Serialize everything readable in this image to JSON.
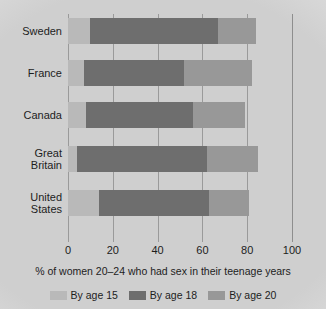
{
  "chart_data": {
    "type": "bar",
    "orientation": "horizontal",
    "stacked": false,
    "overlapping": true,
    "title": "",
    "xlabel": "% of women 20–24 who had sex in their teenage years",
    "ylabel": "",
    "xlim": [
      0,
      100
    ],
    "xticks": [
      0,
      20,
      40,
      60,
      80,
      100
    ],
    "xtick_labels": [
      "0",
      "20",
      "40",
      "60",
      "80",
      "100"
    ],
    "grid": true,
    "legend_position": "bottom",
    "categories": [
      "Sweden",
      "France",
      "Canada",
      "Great Britain",
      "United States"
    ],
    "category_lines": [
      [
        "Sweden"
      ],
      [
        "France"
      ],
      [
        "Canada"
      ],
      [
        "Great",
        "Britain"
      ],
      [
        "United",
        "States"
      ]
    ],
    "series": [
      {
        "name": "By age 15",
        "color": "#b9b9b9",
        "values": [
          10,
          7,
          8,
          4,
          14
        ]
      },
      {
        "name": "By age 18",
        "color": "#6e6e6e",
        "values": [
          67,
          52,
          56,
          62,
          63
        ]
      },
      {
        "name": "By age 20",
        "color": "#989898",
        "values": [
          84,
          82,
          79,
          85,
          81
        ]
      }
    ]
  },
  "legend": {
    "items": [
      {
        "label": "By age 15",
        "color": "#b9b9b9"
      },
      {
        "label": "By age 18",
        "color": "#6e6e6e"
      },
      {
        "label": "By age 20",
        "color": "#989898"
      }
    ]
  },
  "colors": {
    "by_age_15": "#b9b9b9",
    "by_age_18": "#6e6e6e",
    "by_age_20": "#989898",
    "gridline": "#9a9a9a",
    "text": "#1d1d1d"
  }
}
